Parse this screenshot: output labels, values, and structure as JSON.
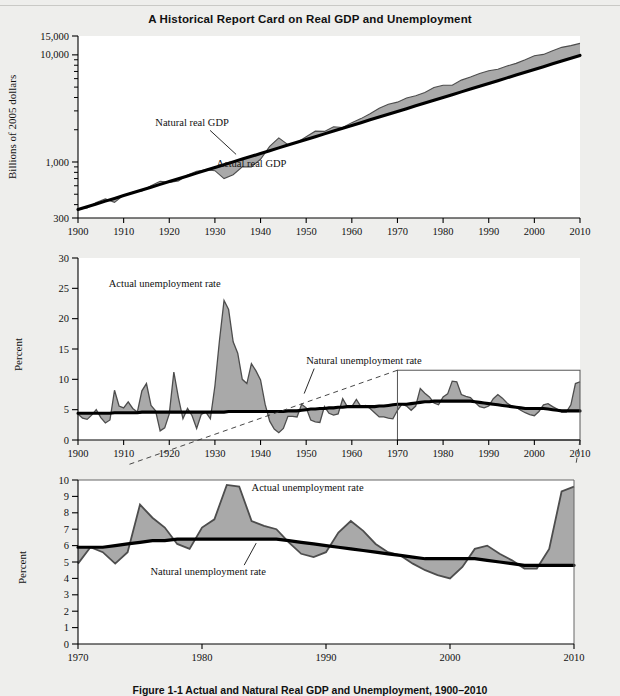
{
  "figure": {
    "title": "A Historical Report Card on Real GDP and Unemployment",
    "caption": "Figure 1-1  Actual and Natural Real GDP and Unemployment, 1900–2010"
  },
  "colors": {
    "page_background": "#eeeeec",
    "plot_background": "#ffffff",
    "gap_fill": "#a9a9a9",
    "natural_line": "#000000",
    "actual_line": "#4d4d4d",
    "axis": "#000000",
    "inset_box": "#555555",
    "leader_dash": "#333333"
  },
  "panels": [
    {
      "id": "real-gdp",
      "ylabel": "Billions of 2005 dollars",
      "yscale": "log",
      "ylim": [
        300,
        15000
      ],
      "ytick_labels": [
        "15,000",
        "10,000",
        "1,000",
        "300"
      ],
      "ytick_values": [
        15000,
        10000,
        1000,
        300
      ],
      "yminor_values": [
        9000,
        8000,
        7000,
        6000,
        5000,
        4000,
        3000,
        2000,
        900,
        800,
        700,
        600,
        500,
        400
      ],
      "xlim": [
        1900,
        2010
      ],
      "xtick_labels": [
        "1900",
        "1910",
        "1920",
        "1930",
        "1940",
        "1950",
        "1960",
        "1970",
        "1980",
        "1990",
        "2000",
        "2010"
      ],
      "xtick_values": [
        1900,
        1910,
        1920,
        1930,
        1940,
        1950,
        1960,
        1970,
        1980,
        1990,
        2000,
        2010
      ],
      "annotations": [
        {
          "text": "Natural real GDP",
          "x": 1925,
          "y": 2150,
          "leader": true
        },
        {
          "text": "Actual real GDP",
          "x": 1938,
          "y": 900,
          "leader": false
        }
      ]
    },
    {
      "id": "unemployment-long",
      "ylabel": "Percent",
      "yscale": "linear",
      "ylim": [
        0,
        30
      ],
      "ytick_labels": [
        "0",
        "5",
        "10",
        "15",
        "20",
        "25",
        "30"
      ],
      "ytick_values": [
        0,
        5,
        10,
        15,
        20,
        25,
        30
      ],
      "xlim": [
        1900,
        2010
      ],
      "xtick_labels": [
        "1900",
        "1910",
        "1920",
        "1930",
        "1940",
        "1950",
        "1960",
        "1970",
        "1980",
        "1990",
        "2000",
        "2010"
      ],
      "xtick_values": [
        1900,
        1910,
        1920,
        1930,
        1940,
        1950,
        1960,
        1970,
        1980,
        1990,
        2000,
        2010
      ],
      "annotations": [
        {
          "text": "Actual unemployment rate",
          "x": 1919,
          "y": 25.2,
          "leader": false
        },
        {
          "text": "Natural unemployment rate",
          "x": 1950,
          "y": 12.6,
          "leader": true
        }
      ],
      "inset_highlight": {
        "x0": 1970,
        "x1": 2010,
        "y0": 0,
        "y1": 11.5
      }
    },
    {
      "id": "unemployment-recent",
      "ylabel": "Percent",
      "yscale": "linear",
      "ylim": [
        0,
        10
      ],
      "ytick_labels": [
        "0",
        "1",
        "2",
        "3",
        "4",
        "5",
        "6",
        "7",
        "8",
        "9",
        "10"
      ],
      "ytick_values": [
        0,
        1,
        2,
        3,
        4,
        5,
        6,
        7,
        8,
        9,
        10
      ],
      "xlim": [
        1970,
        2010
      ],
      "xtick_labels": [
        "1970",
        "1980",
        "1990",
        "2000",
        "2010"
      ],
      "xtick_values": [
        1970,
        1980,
        1990,
        2000,
        2010
      ],
      "annotations": [
        {
          "text": "Actual unemployment rate",
          "x": 1984,
          "y": 9.3,
          "leader": false
        },
        {
          "text": "Natural unemployment rate",
          "x": 1980.5,
          "y": 4.2,
          "leader": true
        }
      ]
    }
  ],
  "chart_data": [
    {
      "type": "line",
      "id": "real-gdp",
      "title": "A Historical Report Card on Real GDP and Unemployment",
      "xlabel": "",
      "ylabel": "Billions of 2005 dollars",
      "yscale": "log",
      "ylim": [
        300,
        15000
      ],
      "xlim": [
        1900,
        2010
      ],
      "grid": false,
      "legend": "inline-annotations",
      "x": [
        1900,
        1902,
        1904,
        1906,
        1908,
        1910,
        1912,
        1914,
        1916,
        1918,
        1920,
        1922,
        1924,
        1926,
        1928,
        1930,
        1932,
        1934,
        1936,
        1938,
        1940,
        1942,
        1944,
        1946,
        1948,
        1950,
        1952,
        1954,
        1956,
        1958,
        1960,
        1962,
        1964,
        1966,
        1968,
        1970,
        1972,
        1974,
        1976,
        1978,
        1980,
        1982,
        1984,
        1986,
        1988,
        1990,
        1992,
        1994,
        1996,
        1998,
        2000,
        2002,
        2004,
        2006,
        2008,
        2010
      ],
      "series": [
        {
          "name": "Natural real GDP",
          "values": [
            360,
            382,
            406,
            431,
            457,
            486,
            516,
            548,
            582,
            618,
            656,
            697,
            741,
            787,
            836,
            888,
            943,
            1002,
            1064,
            1130,
            1200,
            1275,
            1354,
            1438,
            1527,
            1622,
            1723,
            1830,
            1944,
            2065,
            2193,
            2329,
            2474,
            2627,
            2790,
            2963,
            3147,
            3342,
            3549,
            3769,
            4003,
            4251,
            4515,
            4795,
            5092,
            5409,
            5744,
            6100,
            6478,
            6880,
            7308,
            7762,
            8244,
            8757,
            9302,
            9880
          ]
        },
        {
          "name": "Actual real GDP",
          "values": [
            362,
            372,
            418,
            452,
            420,
            490,
            522,
            535,
            600,
            660,
            645,
            665,
            755,
            820,
            845,
            830,
            700,
            760,
            900,
            900,
            1060,
            1400,
            1680,
            1450,
            1520,
            1720,
            1940,
            1930,
            2130,
            2100,
            2330,
            2540,
            2820,
            3180,
            3460,
            3620,
            3950,
            4150,
            4460,
            4960,
            5200,
            5200,
            5810,
            6200,
            6700,
            7100,
            7350,
            7860,
            8330,
            9000,
            9800,
            10100,
            10900,
            11750,
            12200,
            12800
          ]
        }
      ]
    },
    {
      "type": "line",
      "id": "unemployment-long",
      "title": "",
      "xlabel": "",
      "ylabel": "Percent",
      "ylim": [
        0,
        30
      ],
      "xlim": [
        1900,
        2010
      ],
      "grid": false,
      "legend": "inline-annotations",
      "x": [
        1900,
        1901,
        1902,
        1903,
        1904,
        1905,
        1906,
        1907,
        1908,
        1909,
        1910,
        1911,
        1912,
        1913,
        1914,
        1915,
        1916,
        1917,
        1918,
        1919,
        1920,
        1921,
        1922,
        1923,
        1924,
        1925,
        1926,
        1927,
        1928,
        1929,
        1930,
        1931,
        1932,
        1933,
        1934,
        1935,
        1936,
        1937,
        1938,
        1939,
        1940,
        1941,
        1942,
        1943,
        1944,
        1945,
        1946,
        1947,
        1948,
        1949,
        1950,
        1951,
        1952,
        1953,
        1954,
        1955,
        1956,
        1957,
        1958,
        1959,
        1960,
        1961,
        1962,
        1963,
        1964,
        1965,
        1966,
        1967,
        1968,
        1969,
        1970,
        1971,
        1972,
        1973,
        1974,
        1975,
        1976,
        1977,
        1978,
        1979,
        1980,
        1981,
        1982,
        1983,
        1984,
        1985,
        1986,
        1987,
        1988,
        1989,
        1990,
        1991,
        1992,
        1993,
        1994,
        1995,
        1996,
        1997,
        1998,
        1999,
        2000,
        2001,
        2002,
        2003,
        2004,
        2005,
        2006,
        2007,
        2008,
        2009,
        2010
      ],
      "series": [
        {
          "name": "Actual unemployment rate",
          "values": [
            4.3,
            3.6,
            3.4,
            4.1,
            5.0,
            3.7,
            2.8,
            3.3,
            8.2,
            5.6,
            5.3,
            6.3,
            5.2,
            4.6,
            8.1,
            9.3,
            5.7,
            4.8,
            1.5,
            2.0,
            4.3,
            11.2,
            7.0,
            3.5,
            5.2,
            4.0,
            1.9,
            4.2,
            4.6,
            3.5,
            8.9,
            16.4,
            23.0,
            21.5,
            16.2,
            14.3,
            10.0,
            9.3,
            12.6,
            11.4,
            9.9,
            5.9,
            3.1,
            1.8,
            1.2,
            1.9,
            3.9,
            3.9,
            3.8,
            5.9,
            5.3,
            3.3,
            3.0,
            2.9,
            5.5,
            4.4,
            4.1,
            4.3,
            6.8,
            5.5,
            5.5,
            6.7,
            5.5,
            5.7,
            5.2,
            4.5,
            3.8,
            3.8,
            3.6,
            3.5,
            4.9,
            5.9,
            5.6,
            4.9,
            5.6,
            8.5,
            7.7,
            7.1,
            6.1,
            5.8,
            7.1,
            7.6,
            9.7,
            9.6,
            7.5,
            7.2,
            7.0,
            6.2,
            5.5,
            5.3,
            5.6,
            6.8,
            7.5,
            6.9,
            6.1,
            5.6,
            5.4,
            4.9,
            4.5,
            4.2,
            4.0,
            4.7,
            5.8,
            6.0,
            5.5,
            5.1,
            4.6,
            4.6,
            5.8,
            9.3,
            9.6
          ]
        },
        {
          "name": "Natural unemployment rate",
          "values": [
            4.4,
            4.4,
            4.4,
            4.4,
            4.4,
            4.4,
            4.4,
            4.4,
            4.5,
            4.5,
            4.5,
            4.5,
            4.5,
            4.5,
            4.6,
            4.6,
            4.6,
            4.6,
            4.6,
            4.6,
            4.6,
            4.6,
            4.6,
            4.6,
            4.6,
            4.6,
            4.6,
            4.6,
            4.6,
            4.6,
            4.6,
            4.6,
            4.6,
            4.7,
            4.7,
            4.7,
            4.7,
            4.7,
            4.7,
            4.7,
            4.7,
            4.7,
            4.7,
            4.7,
            4.7,
            4.7,
            4.8,
            4.8,
            4.8,
            4.9,
            5.0,
            5.1,
            5.1,
            5.2,
            5.2,
            5.3,
            5.3,
            5.4,
            5.4,
            5.5,
            5.5,
            5.5,
            5.5,
            5.5,
            5.5,
            5.5,
            5.6,
            5.6,
            5.7,
            5.8,
            5.9,
            5.9,
            5.9,
            6.0,
            6.1,
            6.2,
            6.3,
            6.3,
            6.4,
            6.4,
            6.4,
            6.4,
            6.4,
            6.4,
            6.4,
            6.4,
            6.4,
            6.3,
            6.2,
            6.1,
            6.0,
            5.9,
            5.8,
            5.7,
            5.6,
            5.5,
            5.4,
            5.3,
            5.2,
            5.2,
            5.2,
            5.2,
            5.2,
            5.1,
            5.0,
            4.9,
            4.8,
            4.8,
            4.8,
            4.8,
            4.8
          ]
        }
      ]
    },
    {
      "type": "line",
      "id": "unemployment-recent",
      "title": "",
      "xlabel": "",
      "ylabel": "Percent",
      "ylim": [
        0,
        10
      ],
      "xlim": [
        1970,
        2010
      ],
      "grid": false,
      "legend": "inline-annotations",
      "x": [
        1970,
        1971,
        1972,
        1973,
        1974,
        1975,
        1976,
        1977,
        1978,
        1979,
        1980,
        1981,
        1982,
        1983,
        1984,
        1985,
        1986,
        1987,
        1988,
        1989,
        1990,
        1991,
        1992,
        1993,
        1994,
        1995,
        1996,
        1997,
        1998,
        1999,
        2000,
        2001,
        2002,
        2003,
        2004,
        2005,
        2006,
        2007,
        2008,
        2009,
        2010
      ],
      "series": [
        {
          "name": "Actual unemployment rate",
          "values": [
            4.9,
            5.9,
            5.6,
            4.9,
            5.6,
            8.5,
            7.7,
            7.1,
            6.1,
            5.8,
            7.1,
            7.6,
            9.7,
            9.6,
            7.5,
            7.2,
            7.0,
            6.2,
            5.5,
            5.3,
            5.6,
            6.8,
            7.5,
            6.9,
            6.1,
            5.6,
            5.4,
            4.9,
            4.5,
            4.2,
            4.0,
            4.7,
            5.8,
            6.0,
            5.5,
            5.1,
            4.6,
            4.6,
            5.8,
            9.3,
            9.6
          ]
        },
        {
          "name": "Natural unemployment rate",
          "values": [
            5.9,
            5.9,
            5.9,
            6.0,
            6.1,
            6.2,
            6.3,
            6.3,
            6.4,
            6.4,
            6.4,
            6.4,
            6.4,
            6.4,
            6.4,
            6.4,
            6.4,
            6.3,
            6.2,
            6.1,
            6.0,
            5.9,
            5.8,
            5.7,
            5.6,
            5.5,
            5.4,
            5.3,
            5.2,
            5.2,
            5.2,
            5.2,
            5.2,
            5.1,
            5.0,
            4.9,
            4.8,
            4.8,
            4.8,
            4.8,
            4.8
          ]
        }
      ]
    }
  ]
}
